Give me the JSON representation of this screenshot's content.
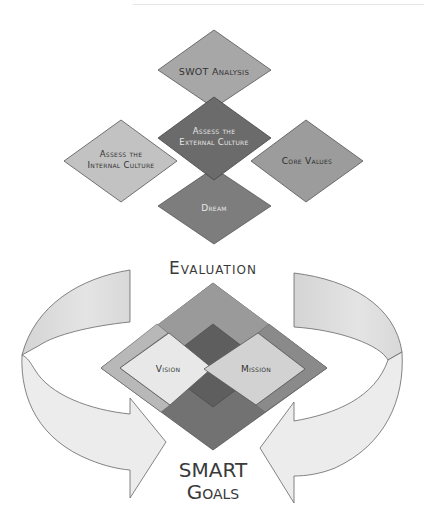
{
  "diagram": {
    "top_cluster": {
      "swot": {
        "label": "SWOT Analysis",
        "fill": "#a7a7a7"
      },
      "external": {
        "line1": "Assess the",
        "line2": "External Culture",
        "fill": "#6b6b6b"
      },
      "internal": {
        "line1": "Assess the",
        "line2": "Internal Culture",
        "fill": "#c2c2c2"
      },
      "core_values": {
        "label": "Core Values",
        "fill": "#999999"
      },
      "dream": {
        "label": "Dream",
        "fill": "#7d7d7d"
      }
    },
    "evaluation_label": "Evaluation",
    "bottom_cluster": {
      "vision": {
        "label": "Vision",
        "fill": "#e8e8e8"
      },
      "mission": {
        "label": "Mission",
        "fill": "#d2d2d2"
      },
      "outer_top_fill": "#9a9a9a",
      "outer_bottom_fill": "#727272",
      "side_strip_fill": "#b5b5b5",
      "center_fill": "#5e5e5e"
    },
    "smart_goals": {
      "line1": "SMART",
      "line2": "Goals"
    },
    "arrows": {
      "fill_light": "#efefef",
      "fill_mid": "#dadada",
      "stroke": "#666666"
    }
  }
}
